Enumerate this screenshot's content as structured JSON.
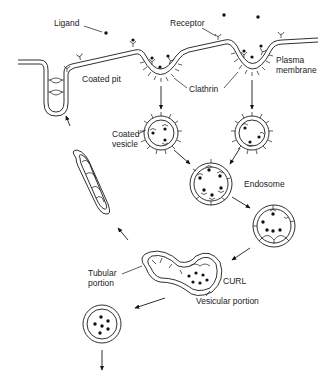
{
  "diagram": {
    "labels": {
      "ligand": "Ligand",
      "receptor": "Receptor",
      "plasma_membrane_1": "Plasma",
      "plasma_membrane_2": "membrane",
      "coated_pit": "Coated pit",
      "clathrin": "Clathrin",
      "coated_vesicle_1": "Coated",
      "coated_vesicle_2": "vesicle",
      "endosome": "Endosome",
      "tubular_portion_1": "Tubular",
      "tubular_portion_2": "portion",
      "curl": "CURL",
      "vesicular_portion": "Vesicular portion"
    },
    "nodes": [
      {
        "id": "plasma-membrane",
        "kind": "membrane"
      },
      {
        "id": "coated-pit-left",
        "kind": "coated-pit"
      },
      {
        "id": "coated-pit-right",
        "kind": "coated-pit"
      },
      {
        "id": "coated-vesicle-left",
        "kind": "coated-vesicle"
      },
      {
        "id": "coated-vesicle-right",
        "kind": "coated-vesicle"
      },
      {
        "id": "endosome",
        "kind": "endosome"
      },
      {
        "id": "endosome-late",
        "kind": "endosome"
      },
      {
        "id": "curl",
        "kind": "curl"
      },
      {
        "id": "ligand-vesicle",
        "kind": "vesicle"
      },
      {
        "id": "recycling-vesicle",
        "kind": "tubule"
      },
      {
        "id": "pit-invagination",
        "kind": "membrane-pit"
      }
    ],
    "edges": [
      {
        "from": "coated-pit-left",
        "to": "coated-vesicle-left"
      },
      {
        "from": "coated-pit-right",
        "to": "coated-vesicle-right"
      },
      {
        "from": "coated-vesicle-left",
        "to": "endosome"
      },
      {
        "from": "coated-vesicle-right",
        "to": "endosome"
      },
      {
        "from": "endosome",
        "to": "endosome-late"
      },
      {
        "from": "endosome-late",
        "to": "curl"
      },
      {
        "from": "curl",
        "to": "ligand-vesicle"
      },
      {
        "from": "ligand-vesicle",
        "to": "lysosome"
      },
      {
        "from": "curl",
        "to": "recycling-vesicle"
      },
      {
        "from": "recycling-vesicle",
        "to": "plasma-membrane"
      }
    ]
  }
}
